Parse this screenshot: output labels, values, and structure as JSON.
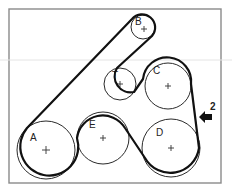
{
  "diagram": {
    "colors": {
      "belt": "#111111",
      "pulley": "#2a2a2a",
      "frame": "#8a8a8a",
      "background": "#ffffff"
    },
    "pulleys": [
      {
        "id": "A",
        "label": "A",
        "cx": 46,
        "cy": 150,
        "r": 29
      },
      {
        "id": "B",
        "label": "B",
        "cx": 143,
        "cy": 27,
        "r": 12
      },
      {
        "id": "T",
        "label": "T",
        "cx": 120,
        "cy": 84,
        "r": 16
      },
      {
        "id": "C",
        "label": "C",
        "cx": 168,
        "cy": 86,
        "r": 23
      },
      {
        "id": "D",
        "label": "D",
        "cx": 171,
        "cy": 148,
        "r": 29
      },
      {
        "id": "E",
        "label": "E",
        "cx": 103,
        "cy": 138,
        "r": 26
      }
    ],
    "callout": {
      "label": "2",
      "description": "belt tension check point arrow"
    }
  }
}
